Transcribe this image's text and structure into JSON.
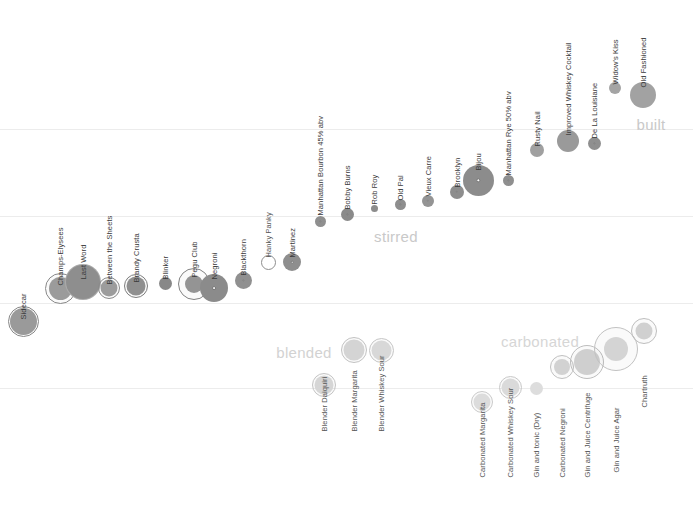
{
  "chart_data": {
    "type": "scatter",
    "title": "",
    "xlabel": "",
    "ylabel": "",
    "grid": true,
    "gridlines_y": [
      129,
      216,
      303,
      388
    ],
    "legend_position": "none",
    "group_labels": [
      {
        "text": "built",
        "x": 651,
        "y": 124,
        "color": "#c9c9c9"
      },
      {
        "text": "stirred",
        "x": 396,
        "y": 236,
        "color": "#c9c9c9"
      },
      {
        "text": "blended",
        "x": 304,
        "y": 352,
        "color": "#d2d2d2"
      },
      {
        "text": "carbonated",
        "x": 540,
        "y": 341,
        "color": "#d6d6d6"
      }
    ],
    "series": [
      {
        "name": "shaken",
        "points": [
          {
            "label": "Sidecar",
            "x": 23,
            "y": 321,
            "r": 13.5,
            "halo": 15.5,
            "ring": true,
            "dot": false,
            "fill": "#9a9a9a",
            "label_y": 312
          },
          {
            "label": "Champs-Elysees",
            "x": 60,
            "y": 288,
            "r": 11.5,
            "halo": 15.5,
            "ring": true,
            "dot": false,
            "fill": "#9b9b9b",
            "label_y": 278
          },
          {
            "label": "Last Word",
            "x": 83,
            "y": 282,
            "r": 17.0,
            "halo": 18.0,
            "ring": false,
            "dot": false,
            "fill": "#8e8e8e",
            "label_y": 272
          },
          {
            "label": "Between the Sheets",
            "x": 109,
            "y": 288,
            "r": 8.5,
            "halo": 11.0,
            "ring": true,
            "dot": false,
            "fill": "#9c9c9c",
            "label_y": 277
          },
          {
            "label": "Brandy Crusta",
            "x": 136,
            "y": 286,
            "r": 9.5,
            "halo": 12.0,
            "ring": true,
            "dot": false,
            "fill": "#8f8f8f",
            "label_y": 275
          },
          {
            "label": "Blinker",
            "x": 165,
            "y": 283,
            "r": 6.5,
            "halo": 0,
            "ring": false,
            "dot": false,
            "fill": "#888888",
            "label_y": 272
          },
          {
            "label": "Pegu Club",
            "x": 194,
            "y": 284,
            "r": 9.0,
            "halo": 16.0,
            "ring": true,
            "dot": false,
            "fill": "#949494",
            "label_y": 270
          },
          {
            "label": "Negroni",
            "x": 214,
            "y": 288,
            "r": 14.0,
            "halo": 0,
            "ring": false,
            "dot": true,
            "fill": "#8b8b8b",
            "label_y": 272
          },
          {
            "label": "Blackthorn",
            "x": 243,
            "y": 280,
            "r": 8.5,
            "halo": 0,
            "ring": false,
            "dot": true,
            "fill": "#909090",
            "label_y": 268
          },
          {
            "label": "Hanky Panky",
            "x": 268,
            "y": 262,
            "r": 7.5,
            "halo": 0,
            "ring": true,
            "dot": false,
            "fill": "#ffffff",
            "label_y": 250
          },
          {
            "label": "Martinez",
            "x": 292,
            "y": 262,
            "r": 9.0,
            "halo": 0,
            "ring": false,
            "dot": true,
            "fill": "#8e8e8e",
            "label_y": 250
          },
          {
            "label": "Manhattan Bourbon 45% abv",
            "x": 320,
            "y": 221,
            "r": 5.5,
            "halo": 0,
            "ring": false,
            "dot": true,
            "fill": "#8f8f8f",
            "label_y": 208
          },
          {
            "label": "Bobby Burns",
            "x": 347,
            "y": 214,
            "r": 6.5,
            "halo": 0,
            "ring": false,
            "dot": true,
            "fill": "#8a8a8a",
            "label_y": 202
          },
          {
            "label": "Rob Roy",
            "x": 374,
            "y": 208,
            "r": 3.5,
            "halo": 0,
            "ring": false,
            "dot": false,
            "fill": "#8c8c8c",
            "label_y": 197
          },
          {
            "label": "Old Pal",
            "x": 400,
            "y": 204,
            "r": 5.5,
            "halo": 0,
            "ring": false,
            "dot": true,
            "fill": "#8e8e8e",
            "label_y": 193
          },
          {
            "label": "Vieux Carre",
            "x": 428,
            "y": 201,
            "r": 6.0,
            "halo": 0,
            "ring": false,
            "dot": true,
            "fill": "#949494",
            "label_y": 189
          },
          {
            "label": "Brooklyn",
            "x": 457,
            "y": 192,
            "r": 7.0,
            "halo": 0,
            "ring": false,
            "dot": true,
            "fill": "#8d8d8d",
            "label_y": 180
          },
          {
            "label": "Bijou",
            "x": 478,
            "y": 180,
            "r": 15.5,
            "halo": 0,
            "ring": false,
            "dot": true,
            "fill": "#8c8c8c",
            "label_y": 163
          },
          {
            "label": "Manhattan Rye 50% abv",
            "x": 508,
            "y": 180,
            "r": 5.5,
            "halo": 0,
            "ring": false,
            "dot": true,
            "fill": "#8f8f8f",
            "label_y": 168
          },
          {
            "label": "Rusty Nail",
            "x": 537,
            "y": 150,
            "r": 7.0,
            "halo": 0,
            "ring": false,
            "dot": false,
            "fill": "#a0a0a0",
            "label_y": 139
          },
          {
            "label": "Improved Whiskey Cocktail",
            "x": 568,
            "y": 141,
            "r": 11.0,
            "halo": 0,
            "ring": false,
            "dot": false,
            "fill": "#9a9a9a",
            "label_y": 128
          },
          {
            "label": "De La Louisiane",
            "x": 594,
            "y": 143,
            "r": 6.5,
            "halo": 0,
            "ring": false,
            "dot": true,
            "fill": "#8f8f8f",
            "label_y": 131
          },
          {
            "label": "Widow's Kiss",
            "x": 615,
            "y": 88,
            "r": 6.0,
            "halo": 0,
            "ring": false,
            "dot": false,
            "fill": "#a4a4a4",
            "label_y": 77
          },
          {
            "label": "Old Fashioned",
            "x": 643,
            "y": 95,
            "r": 13.0,
            "halo": 0,
            "ring": false,
            "dot": false,
            "fill": "#a2a2a2",
            "label_y": 80
          },
          {
            "label": "Blender Daiquiri",
            "x": 324,
            "y": 385,
            "r": 9.5,
            "halo": 12.0,
            "ring": true,
            "dot": false,
            "fill": "#d6d6d6",
            "label_y": 424
          },
          {
            "label": "Blender Margarita",
            "x": 354,
            "y": 350,
            "r": 10.5,
            "halo": 13.0,
            "ring": true,
            "dot": false,
            "fill": "#d4d4d4",
            "label_y": 424
          },
          {
            "label": "Blender Whiskey Sour",
            "x": 381,
            "y": 350,
            "r": 10.0,
            "halo": 12.5,
            "ring": true,
            "dot": false,
            "fill": "#d8d8d8",
            "label_y": 424
          },
          {
            "label": "Carbonated Margarita",
            "x": 482,
            "y": 402,
            "r": 8.5,
            "halo": 11.0,
            "ring": true,
            "dot": false,
            "fill": "#dcdcdc",
            "label_y": 470
          },
          {
            "label": "Carbonated Whiskey Sour",
            "x": 510,
            "y": 387,
            "r": 9.0,
            "halo": 11.5,
            "ring": true,
            "dot": false,
            "fill": "#dadada",
            "label_y": 470
          },
          {
            "label": "Gin and tonic (Dry)",
            "x": 536,
            "y": 388,
            "r": 6.5,
            "halo": 0,
            "ring": false,
            "dot": false,
            "fill": "#dddddd",
            "label_y": 470
          },
          {
            "label": "Carbonated Negroni",
            "x": 562,
            "y": 367,
            "r": 8.0,
            "halo": 12.0,
            "ring": true,
            "dot": false,
            "fill": "#d2d2d2",
            "label_y": 470
          },
          {
            "label": "Gin and Juice Centrifuge",
            "x": 587,
            "y": 362,
            "r": 13.0,
            "halo": 17.0,
            "ring": true,
            "dot": false,
            "fill": "#cfcfcf",
            "label_y": 470
          },
          {
            "label": "Gin and Juice Agar",
            "x": 616,
            "y": 349,
            "r": 12.0,
            "halo": 22.0,
            "ring": true,
            "dot": false,
            "fill": "#d4d4d4",
            "label_y": 465
          },
          {
            "label": "Chartruth",
            "x": 644,
            "y": 331,
            "r": 8.5,
            "halo": 13.0,
            "ring": true,
            "dot": false,
            "fill": "#d0d0d0",
            "label_y": 400
          }
        ]
      }
    ]
  }
}
